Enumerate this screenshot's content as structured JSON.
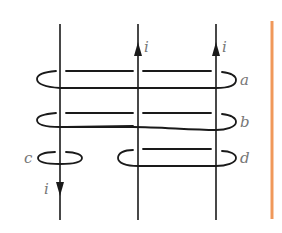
{
  "diagram": {
    "type": "current-carrying wires with Amperian loops",
    "wires": [
      {
        "id": "left",
        "direction": "down",
        "current_label": "i"
      },
      {
        "id": "middle",
        "direction": "up",
        "current_label": "i"
      },
      {
        "id": "right",
        "direction": "up",
        "current_label": "i"
      }
    ],
    "loops": [
      {
        "label": "a",
        "encloses": [
          "left",
          "middle",
          "right"
        ]
      },
      {
        "label": "b",
        "encloses": [
          "left",
          "middle",
          "right"
        ]
      },
      {
        "label": "c",
        "encloses": [
          "left"
        ]
      },
      {
        "label": "d",
        "encloses": [
          "middle",
          "right"
        ]
      }
    ],
    "labels": {
      "current_left": "i",
      "current_middle": "i",
      "current_right": "i",
      "loop_a": "a",
      "loop_b": "b",
      "loop_c": "c",
      "loop_d": "d"
    },
    "colors": {
      "line": "#1a1a1a",
      "label": "#777777",
      "side_bar": "#f0985a"
    }
  }
}
